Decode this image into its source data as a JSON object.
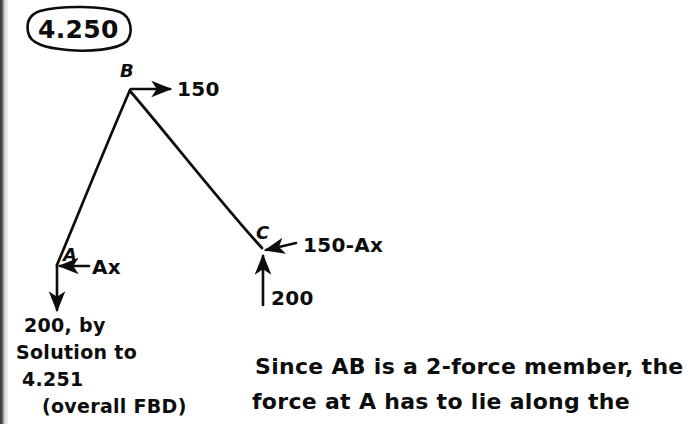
{
  "page": {
    "title": "4.250",
    "background_color": "#ffffff",
    "ink_color": "#0d0d0d",
    "width": 692,
    "height": 424
  },
  "diagram": {
    "name": "free-body-diagram",
    "nodes": [
      {
        "id": "B",
        "label": "B",
        "x": 130,
        "y": 90
      },
      {
        "id": "A",
        "label": "A",
        "x": 57,
        "y": 266
      },
      {
        "id": "C",
        "label": "C",
        "x": 263,
        "y": 249
      }
    ],
    "members": [
      {
        "from": "B",
        "to": "A"
      },
      {
        "from": "B",
        "to": "C"
      }
    ],
    "forces": [
      {
        "id": "force-b",
        "at": "B",
        "label": "150",
        "direction": "right"
      },
      {
        "id": "force-ax",
        "at": "A",
        "label": "Ax",
        "direction": "left"
      },
      {
        "id": "force-ay",
        "at": "A",
        "label": "200, by",
        "direction": "down"
      },
      {
        "id": "force-c-horizontal",
        "at": "C",
        "label": "150-Ax",
        "direction": "left"
      },
      {
        "id": "force-c-vertical",
        "at": "C",
        "label": "200",
        "direction": "up"
      }
    ]
  },
  "annotations": {
    "force_a_note": [
      "200, by",
      "Solution to",
      "4.251",
      "(overall FBD)"
    ],
    "explanation": [
      "Since AB is a 2-force member, the",
      "force at A has to lie along the"
    ]
  }
}
